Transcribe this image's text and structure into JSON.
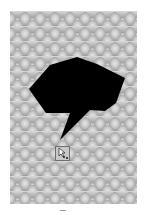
{
  "canvas": {
    "background": "#ffffff",
    "panel": {
      "texture": "grey-scale-pattern",
      "colors": {
        "light": "#e6e6e6",
        "mid": "#cfcfcf",
        "dark": "#9a9a9a"
      }
    }
  },
  "shape": {
    "type": "speech-bubble-polygon",
    "fill": "#000000",
    "points": "29,89 50,65 77,57 97,64 125,78 116,103 105,111 90,110 60,140 70,113 46,113 36,99"
  },
  "tool": {
    "icon": "pen-edit-nodes-icon",
    "tooltip": ""
  },
  "caption": {
    "text": ""
  }
}
